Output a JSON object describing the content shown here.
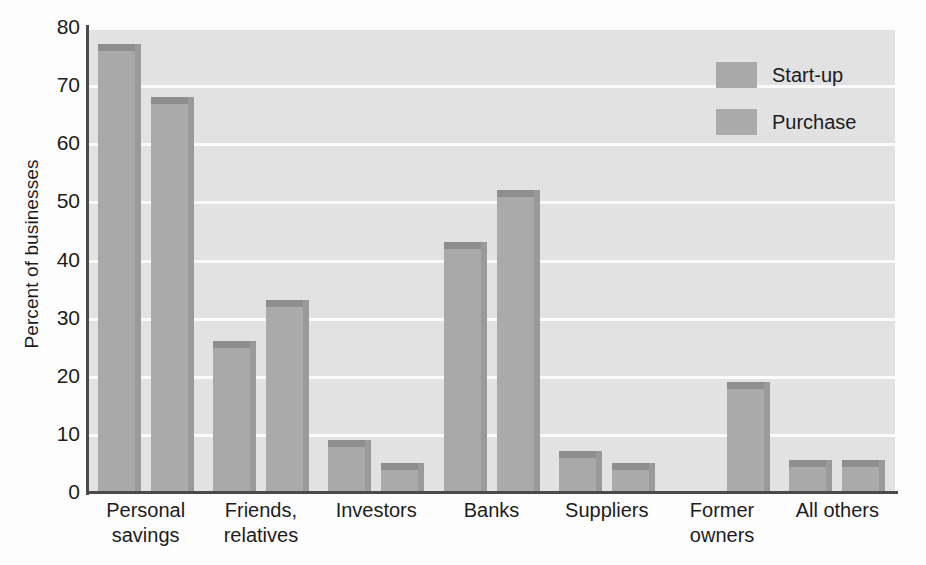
{
  "chart_data": {
    "type": "bar",
    "title": "",
    "xlabel": "",
    "ylabel": "Percent of businesses",
    "ylim": [
      0,
      80
    ],
    "yticks": [
      0,
      10,
      20,
      30,
      40,
      50,
      60,
      70,
      80
    ],
    "ytick_labels": [
      "0",
      "10",
      "20",
      "30",
      "40",
      "50",
      "60",
      "70",
      "80"
    ],
    "grid": "horizontal",
    "legend_position": "top-right",
    "categories": [
      "Personal savings",
      "Friends, relatives",
      "Investors",
      "Banks",
      "Suppliers",
      "Former owners",
      "All others"
    ],
    "category_lines": [
      [
        "Personal",
        "savings"
      ],
      [
        "Friends,",
        "relatives"
      ],
      [
        "Investors"
      ],
      [
        "Banks"
      ],
      [
        "Suppliers"
      ],
      [
        "Former",
        "owners"
      ],
      [
        "All others"
      ]
    ],
    "series": [
      {
        "name": "Start-up",
        "color": "#a9a9a9",
        "values": [
          77,
          26,
          9,
          43,
          7,
          null,
          5.5
        ]
      },
      {
        "name": "Purchase",
        "color": "#aaaaaa",
        "values": [
          68,
          33,
          5,
          52,
          5,
          19,
          5.5
        ]
      }
    ]
  },
  "legend": {
    "items": [
      {
        "label": "Start-up"
      },
      {
        "label": "Purchase"
      }
    ]
  },
  "colors": {
    "bar_face": "#a9a9a9",
    "bar_top": "#8e8e8e",
    "bar_side": "#9a9a9a",
    "plot_background": "#e2e2e2",
    "gridline": "#fbfbfb",
    "axis": "#4a4a4a",
    "text": "#1c1c1c"
  }
}
